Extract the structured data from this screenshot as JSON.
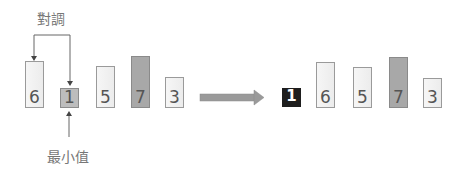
{
  "diagram": {
    "type": "selection-sort-step",
    "swap_label": "對調",
    "min_label": "最小值",
    "before": [
      {
        "value": "6",
        "style": "light",
        "x": 25,
        "top": 61
      },
      {
        "value": "1",
        "style": "mid",
        "x": 60,
        "top": 88
      },
      {
        "value": "5",
        "style": "light",
        "x": 96,
        "top": 66
      },
      {
        "value": "7",
        "style": "dark",
        "x": 131,
        "top": 56
      },
      {
        "value": "3",
        "style": "light",
        "x": 165,
        "top": 77
      }
    ],
    "after": [
      {
        "value": "1",
        "style": "black",
        "x": 282,
        "top": 88
      },
      {
        "value": "6",
        "style": "light",
        "x": 316,
        "top": 62
      },
      {
        "value": "5",
        "style": "light",
        "x": 353,
        "top": 67
      },
      {
        "value": "7",
        "style": "dark",
        "x": 389,
        "top": 57
      },
      {
        "value": "3",
        "style": "light",
        "x": 423,
        "top": 78
      }
    ],
    "colors": {
      "bar_light": "#f2f2f2",
      "bar_dark": "#a8a8a8",
      "bar_min": "#bdbdbd",
      "bar_sorted": "#1e1e1e",
      "arrow": "#9a9a9a",
      "line": "#666666"
    }
  }
}
